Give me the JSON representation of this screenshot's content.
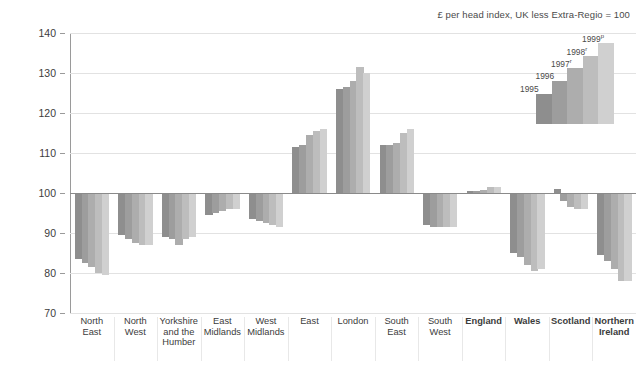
{
  "caption": "£ per head index, UK less Extra-Regio = 100",
  "axis": {
    "y_ticks": [
      "140",
      "130",
      "120",
      "110",
      "100",
      "90",
      "80",
      "70"
    ],
    "y_min": 70,
    "y_max": 140,
    "baseline": 100
  },
  "legend": {
    "title": "",
    "entries": [
      {
        "label": "1995",
        "sup": "",
        "color": "#8e8e8e",
        "height": 30
      },
      {
        "label": "1996",
        "sup": "",
        "color": "#9d9d9d",
        "height": 43
      },
      {
        "label": "1997",
        "sup": "r",
        "color": "#adadad",
        "height": 56
      },
      {
        "label": "1998",
        "sup": "r",
        "color": "#bdbdbd",
        "height": 68
      },
      {
        "label": "1999",
        "sup": "p",
        "color": "#d0d0d0",
        "height": 81
      }
    ]
  },
  "series_colors": [
    "#8e8e8e",
    "#9d9d9d",
    "#adadad",
    "#bdbdbd",
    "#d0d0d0"
  ],
  "chart_data": {
    "type": "bar",
    "title": "",
    "subtitle": "£ per head index, UK less Extra-Regio = 100",
    "xlabel": "",
    "ylabel": "",
    "ylim": [
      70,
      140
    ],
    "baseline": 100,
    "grid": true,
    "legend_position": "top-right",
    "categories": [
      "North East",
      "North West",
      "Yorkshire and the Humber",
      "East Midlands",
      "West Midlands",
      "East",
      "London",
      "South East",
      "South West",
      "England",
      "Wales",
      "Scotland",
      "Northern Ireland"
    ],
    "categories_bold": [
      false,
      false,
      false,
      false,
      false,
      false,
      false,
      false,
      false,
      true,
      true,
      true,
      true
    ],
    "series": [
      {
        "name": "1995",
        "values": [
          83.5,
          89.5,
          89.0,
          94.5,
          93.5,
          111.5,
          126.0,
          112.0,
          92.0,
          100.4,
          85.0,
          101.0,
          84.5
        ]
      },
      {
        "name": "1996",
        "values": [
          82.5,
          88.5,
          88.5,
          95.0,
          93.0,
          112.0,
          126.5,
          112.0,
          91.5,
          100.5,
          84.0,
          98.0,
          83.0
        ]
      },
      {
        "name": "1997",
        "values": [
          81.5,
          87.5,
          87.0,
          95.5,
          92.5,
          114.5,
          128.0,
          112.5,
          91.5,
          100.7,
          82.0,
          96.5,
          81.0
        ]
      },
      {
        "name": "1998",
        "values": [
          80.0,
          87.0,
          88.5,
          96.0,
          92.0,
          115.5,
          131.5,
          115.0,
          91.5,
          101.4,
          80.5,
          96.0,
          78.0
        ]
      },
      {
        "name": "1999",
        "values": [
          79.5,
          87.0,
          89.0,
          96.0,
          91.5,
          116.0,
          130.0,
          116.0,
          91.5,
          101.4,
          81.0,
          96.0,
          78.0
        ]
      }
    ]
  }
}
